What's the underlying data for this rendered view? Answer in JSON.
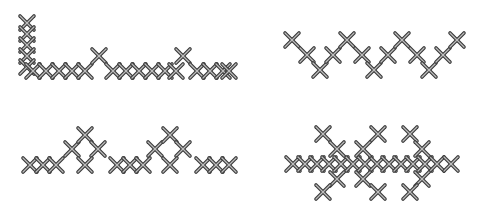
{
  "colors": {
    "background": "#ffffff",
    "stitch_outline": "#3a3a3a",
    "stitch_highlight": "#bdbdbd"
  },
  "stitch_size": 14,
  "patterns": [
    {
      "name": "corner-border-pattern",
      "stitches": [
        [
          27,
          23
        ],
        [
          27,
          34
        ],
        [
          27,
          45
        ],
        [
          27,
          56
        ],
        [
          27,
          67
        ],
        [
          33,
          71
        ],
        [
          46,
          71
        ],
        [
          59,
          71
        ],
        [
          72,
          71
        ],
        [
          85,
          71
        ],
        [
          99,
          56
        ],
        [
          113,
          71
        ],
        [
          126,
          71
        ],
        [
          139,
          71
        ],
        [
          152,
          71
        ],
        [
          165,
          71
        ],
        [
          176,
          71
        ],
        [
          183,
          56
        ],
        [
          197,
          71
        ],
        [
          210,
          71
        ],
        [
          223,
          71
        ],
        [
          229,
          71
        ]
      ]
    },
    {
      "name": "zigzag-pattern",
      "stitches": [
        [
          292,
          40
        ],
        [
          307,
          55
        ],
        [
          320,
          70
        ],
        [
          333,
          55
        ],
        [
          347,
          40
        ],
        [
          362,
          55
        ],
        [
          374,
          70
        ],
        [
          388,
          55
        ],
        [
          402,
          40
        ],
        [
          417,
          55
        ],
        [
          429,
          70
        ],
        [
          443,
          55
        ],
        [
          457,
          40
        ]
      ]
    },
    {
      "name": "diamond-border-pattern",
      "stitches": [
        [
          30,
          165
        ],
        [
          43,
          165
        ],
        [
          56,
          165
        ],
        [
          72,
          149
        ],
        [
          85,
          135
        ],
        [
          98,
          149
        ],
        [
          85,
          165
        ],
        [
          117,
          165
        ],
        [
          130,
          165
        ],
        [
          143,
          165
        ],
        [
          155,
          149
        ],
        [
          170,
          135
        ],
        [
          183,
          149
        ],
        [
          170,
          165
        ],
        [
          203,
          165
        ],
        [
          216,
          165
        ],
        [
          229,
          165
        ]
      ]
    },
    {
      "name": "branch-border-pattern",
      "stitches": [
        [
          293,
          164
        ],
        [
          305,
          164
        ],
        [
          317,
          164
        ],
        [
          329,
          164
        ],
        [
          341,
          164
        ],
        [
          353,
          164
        ],
        [
          365,
          164
        ],
        [
          377,
          164
        ],
        [
          389,
          164
        ],
        [
          401,
          164
        ],
        [
          413,
          164
        ],
        [
          425,
          164
        ],
        [
          437,
          164
        ],
        [
          451,
          164
        ],
        [
          323,
          134
        ],
        [
          337,
          149
        ],
        [
          337,
          179
        ],
        [
          323,
          192
        ],
        [
          378,
          134
        ],
        [
          363,
          149
        ],
        [
          363,
          179
        ],
        [
          378,
          192
        ],
        [
          410,
          134
        ],
        [
          422,
          149
        ],
        [
          422,
          179
        ],
        [
          410,
          192
        ]
      ]
    }
  ]
}
